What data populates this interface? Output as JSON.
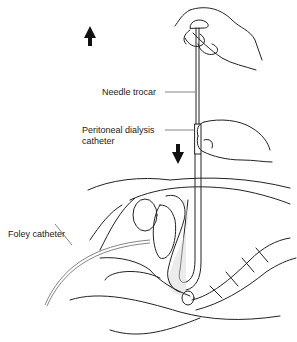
{
  "figure": {
    "labels": {
      "needle_trocar": "Needle trocar",
      "pd_catheter_line1": "Peritoneal dialysis",
      "pd_catheter_line2": "catheter",
      "foley_catheter": "Foley catheter"
    },
    "arrows": [
      {
        "name": "withdraw-trocar-arrow",
        "direction": "up"
      },
      {
        "name": "advance-catheter-arrow",
        "direction": "down"
      }
    ]
  }
}
